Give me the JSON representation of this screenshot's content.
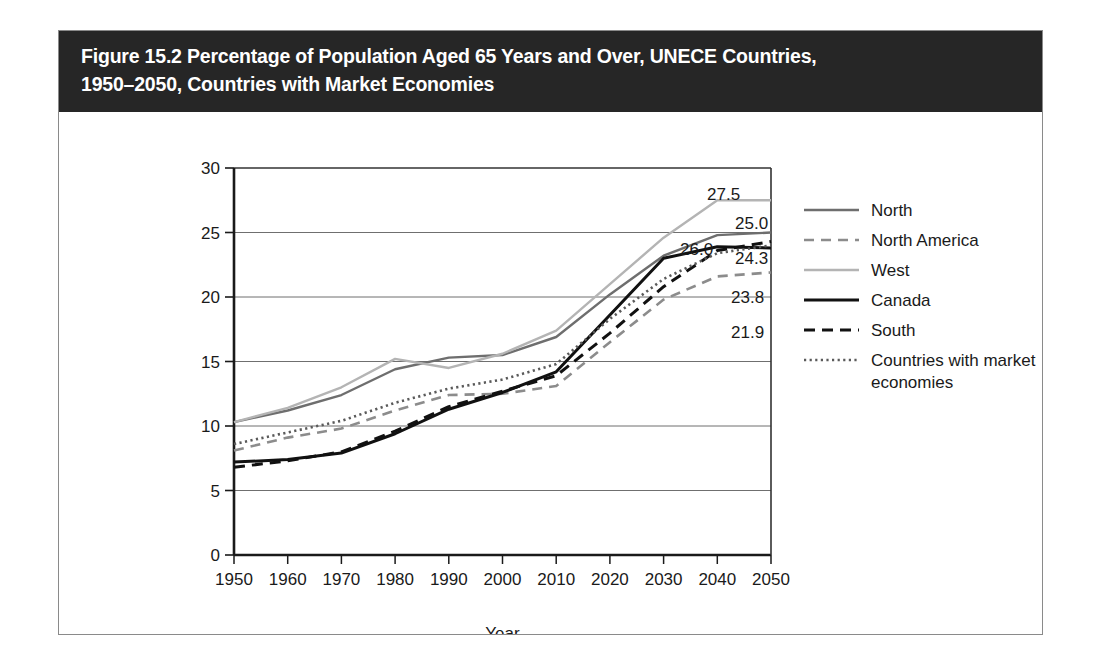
{
  "figure": {
    "title": "Figure 15.2 Percentage of Population Aged 65 Years and Over, UNECE Countries,\n1950–2050, Countries with Market Economies",
    "title_background": "#262626",
    "title_color": "#ffffff"
  },
  "chart_data": {
    "type": "line",
    "title": "Figure 15.2 Percentage of Population Aged 65 Years and Over, UNECE Countries, 1950–2050, Countries with Market Economies",
    "xlabel": "Year",
    "ylabel": "",
    "x": [
      1950,
      1960,
      1970,
      1980,
      1990,
      2000,
      2010,
      2020,
      2030,
      2040,
      2050
    ],
    "xticklabels": [
      "1950",
      "1960",
      "1970",
      "1980",
      "1990",
      "2000",
      "2010",
      "2020",
      "2030",
      "2040",
      "2050"
    ],
    "yticks": [
      0,
      5,
      10,
      15,
      20,
      25,
      30
    ],
    "yticklabels": [
      "0",
      "5",
      "10",
      "15",
      "20",
      "25",
      "30"
    ],
    "ylim": [
      0,
      30
    ],
    "xlim": [
      1950,
      2050
    ],
    "grid": "horizontal",
    "legend_position": "right",
    "series": [
      {
        "name": "North",
        "color": "#6e6e6e",
        "style": "solid",
        "width": 2.4,
        "values": [
          10.3,
          11.2,
          12.4,
          14.4,
          15.3,
          15.5,
          16.9,
          20.2,
          23.2,
          24.8,
          25.0
        ],
        "end_label": "25.0"
      },
      {
        "name": "North America",
        "color": "#8c8c8c",
        "style": "dashed",
        "width": 2.6,
        "values": [
          8.1,
          9.1,
          9.8,
          11.2,
          12.4,
          12.5,
          13.1,
          16.5,
          19.8,
          21.6,
          21.9
        ],
        "end_label": "21.9"
      },
      {
        "name": "West",
        "color": "#b4b4b4",
        "style": "solid",
        "width": 2.4,
        "values": [
          10.3,
          11.4,
          13.0,
          15.2,
          14.5,
          15.6,
          17.4,
          21.0,
          24.6,
          27.5,
          27.5
        ],
        "end_label": "27.5"
      },
      {
        "name": "Canada",
        "color": "#111111",
        "style": "solid",
        "width": 3.0,
        "values": [
          7.2,
          7.4,
          7.9,
          9.4,
          11.3,
          12.6,
          14.2,
          18.6,
          23.0,
          23.9,
          23.8
        ],
        "end_label": "23.8"
      },
      {
        "name": "South",
        "color": "#111111",
        "style": "dashed",
        "width": 3.0,
        "values": [
          6.8,
          7.3,
          8.0,
          9.6,
          11.5,
          12.7,
          13.9,
          17.2,
          20.8,
          23.6,
          24.3
        ],
        "end_label": "24.3"
      },
      {
        "name": "Countries with market economies",
        "color": "#5a5a5a",
        "style": "dotted",
        "width": 2.6,
        "values": [
          8.6,
          9.5,
          10.4,
          11.8,
          12.9,
          13.6,
          14.8,
          18.3,
          21.4,
          23.4,
          24.0
        ],
        "end_label": "26.0"
      }
    ],
    "data_labels": [
      {
        "text": "27.5",
        "series": "West"
      },
      {
        "text": "25.0",
        "series": "North"
      },
      {
        "text": "26.0",
        "series": "Countries with market economies"
      },
      {
        "text": "24.3",
        "series": "South"
      },
      {
        "text": "23.8",
        "series": "Canada"
      },
      {
        "text": "21.9",
        "series": "North America"
      }
    ]
  },
  "legend": {
    "items": [
      {
        "label": "North"
      },
      {
        "label": "North America"
      },
      {
        "label": "West"
      },
      {
        "label": "Canada"
      },
      {
        "label": "South"
      },
      {
        "label": "Countries with market\neconomies"
      }
    ]
  }
}
